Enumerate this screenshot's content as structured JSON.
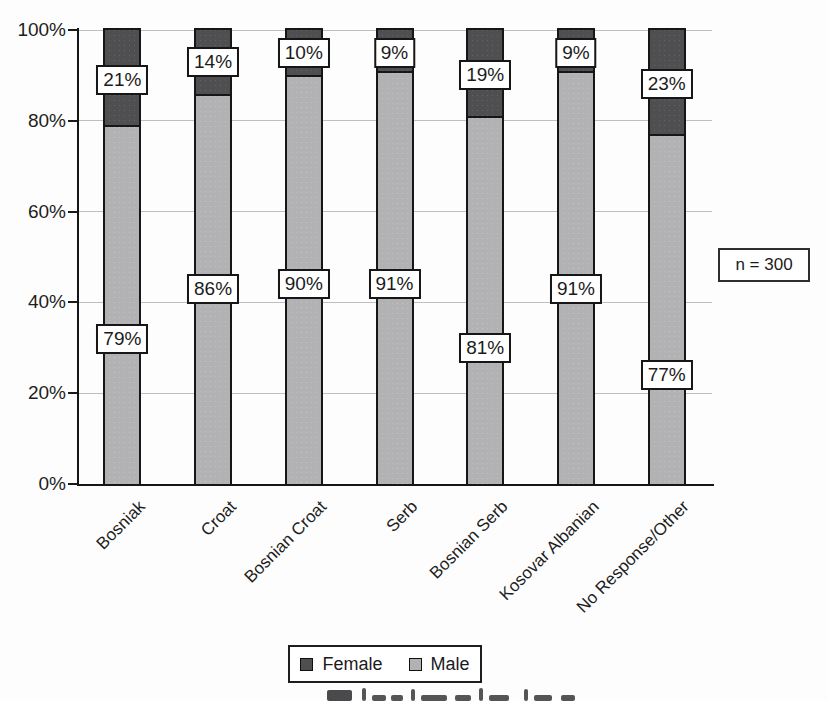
{
  "figure": {
    "annotation": "n = 300"
  },
  "chart_data": {
    "type": "bar",
    "subtype": "stacked-percentage-column",
    "title": "",
    "xlabel": "",
    "ylabel": "",
    "categories": [
      "Bosniak",
      "Croat",
      "Bosnian Croat",
      "Serb",
      "Bosnian Serb",
      "Kosovar Albanian",
      "No Response/Other"
    ],
    "series": [
      {
        "name": "Female",
        "color": "#4f4f51",
        "values": [
          21,
          14,
          10,
          9,
          19,
          9,
          23
        ],
        "label_y_percent": [
          89,
          93,
          95,
          95,
          90,
          95,
          88
        ]
      },
      {
        "name": "Male",
        "color": "#b2b2b4",
        "values": [
          79,
          86,
          90,
          91,
          81,
          91,
          77
        ],
        "label_y_percent": [
          32,
          43,
          44,
          44,
          30,
          43,
          24
        ]
      }
    ],
    "value_suffix": "%",
    "ylim": [
      0,
      100
    ],
    "y_ticks": [
      0,
      20,
      40,
      60,
      80,
      100
    ],
    "y_tick_labels": [
      "0%",
      "20%",
      "40%",
      "60%",
      "80%",
      "100%"
    ],
    "grid": "horizontal",
    "legend_position": "bottom",
    "annotation": "n = 300"
  }
}
